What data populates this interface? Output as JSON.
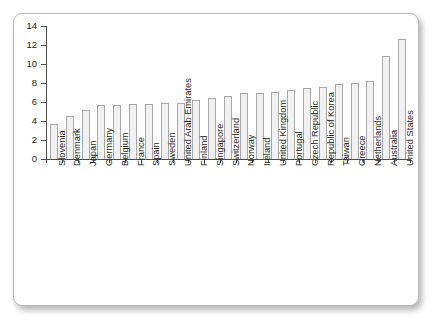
{
  "chart_data": {
    "type": "bar",
    "title": "",
    "subtitle": "",
    "xlabel": "",
    "ylabel": "",
    "ylim": [
      0,
      14
    ],
    "yticks": [
      0,
      2,
      4,
      6,
      8,
      10,
      12,
      14
    ],
    "ytick_labels": [
      "0",
      "2",
      "4",
      "6",
      "8",
      "10",
      "12",
      "14"
    ],
    "grid": false,
    "legend": false,
    "legend_position": "none",
    "bar_fill_color": "#f1f1f1",
    "bar_edge_color": "#a8a8a8",
    "axis_color": "#4d4d4d",
    "categories": [
      "Slovenia",
      "Denmark",
      "Japan",
      "Germany",
      "Belgium",
      "France",
      "Spain",
      "Sweden",
      "United Arab Emirates",
      "Finland",
      "Singapore",
      "Switzerland",
      "Norway",
      "Ireland",
      "United Kingdom",
      "Portugal",
      "Czech Republic",
      "Republic of Korea",
      "Taiwan",
      "Greece",
      "Netherlands",
      "Australia",
      "United States"
    ],
    "values": [
      3.7,
      4.5,
      5.15,
      5.7,
      5.7,
      5.75,
      5.8,
      5.9,
      5.9,
      6.25,
      6.4,
      6.65,
      6.9,
      7.0,
      7.1,
      7.3,
      7.5,
      7.6,
      7.9,
      8.0,
      8.2,
      10.8,
      12.6
    ]
  }
}
